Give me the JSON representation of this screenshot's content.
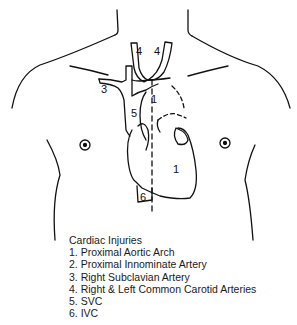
{
  "diagram": {
    "labels": {
      "l1_top": "1",
      "l1_heart": "1",
      "l3": "3",
      "l4_left": "4",
      "l4_right": "4",
      "l5": "5",
      "l6": "6"
    }
  },
  "legend": {
    "title": "Cardiac Injuries",
    "items": [
      "1. Proximal Aortic Arch",
      "2. Proximal Innominate Artery",
      "3. Right Subclavian Artery",
      "4. Right & Left Common Carotid Arteries",
      "5. SVC",
      "6. IVC"
    ]
  }
}
